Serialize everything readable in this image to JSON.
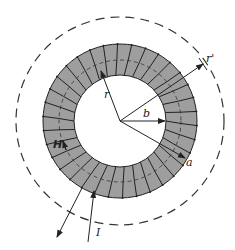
{
  "figure": {
    "colors": {
      "core_fill": "#9e9e9e",
      "stroke": "#222222",
      "background": "#ffffff"
    },
    "geometry": {
      "center": [
        120,
        121
      ],
      "inner_radius": 46,
      "outer_radius": 77,
      "mean_radius": 61,
      "outer_path_radius": 104,
      "turn_count": 34
    },
    "labels": {
      "r": "r",
      "r_prime": "r'",
      "b": "b",
      "a": "a",
      "H": "H",
      "I": "I"
    }
  }
}
